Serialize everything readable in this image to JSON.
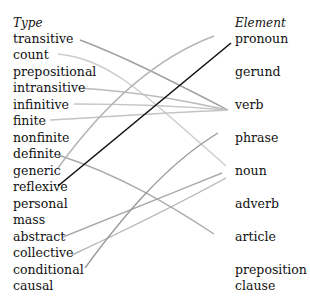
{
  "left": {
    "header": "Type",
    "items": [
      "transitive",
      "count",
      "prepositional",
      "intransitive",
      "infinitive",
      "finite",
      "nonfinite",
      "definite",
      "generic",
      "reflexive",
      "personal",
      "mass",
      "abstract",
      "collective",
      "conditional",
      "causal"
    ]
  },
  "right": {
    "header": "Element",
    "items": [
      "pronoun",
      "gerund",
      "verb",
      "phrase",
      "noun",
      "adverb",
      "article",
      "preposition",
      "clause"
    ]
  },
  "links": [
    {
      "from": "transitive",
      "to": "verb",
      "color": "#a0a0a0"
    },
    {
      "from": "count",
      "to": "noun",
      "color": "#c8c8c8"
    },
    {
      "from": "intransitive",
      "to": "verb",
      "color": "#b8b8b8"
    },
    {
      "from": "infinitive",
      "to": "verb",
      "color": "#c0c0c0"
    },
    {
      "from": "finite",
      "to": "verb",
      "color": "#c0c0c0"
    },
    {
      "from": "definite",
      "to": "article",
      "color": "#a8a8a8"
    },
    {
      "from": "generic",
      "to": "pronoun",
      "color": "#b0b0b0"
    },
    {
      "from": "reflexive",
      "to": "pronoun",
      "color": "#111111"
    },
    {
      "from": "abstract",
      "to": "noun",
      "color": "#a8a8a8"
    },
    {
      "from": "collective",
      "to": "noun",
      "color": "#b0b0b0"
    },
    {
      "from": "conditional",
      "to": "phrase",
      "color": "#989898"
    }
  ]
}
